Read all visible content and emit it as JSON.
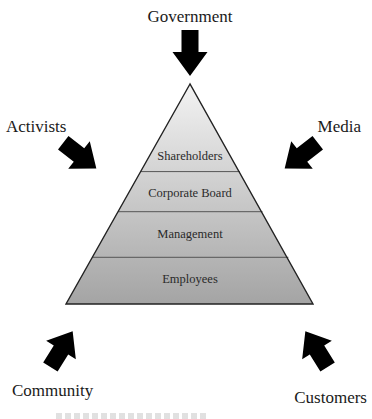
{
  "diagram": {
    "type": "stakeholder-pyramid",
    "pyramid": {
      "tiers": [
        {
          "label": "Shareholders"
        },
        {
          "label": "Corporate Board"
        },
        {
          "label": "Management"
        },
        {
          "label": "Employees"
        }
      ],
      "fill_top": "#f3f3f3",
      "fill_bottom": "#a4a4a4",
      "outline_color": "#222222"
    },
    "external_forces": [
      {
        "id": "government",
        "label": "Government",
        "position": "top",
        "arrow_direction": "down"
      },
      {
        "id": "activists",
        "label": "Activists",
        "position": "upper-left",
        "arrow_direction": "down-right"
      },
      {
        "id": "media",
        "label": "Media",
        "position": "upper-right",
        "arrow_direction": "down-left"
      },
      {
        "id": "community",
        "label": "Community",
        "position": "bottom-left",
        "arrow_direction": "up-right"
      },
      {
        "id": "customers",
        "label": "Customers",
        "position": "bottom-right",
        "arrow_direction": "up-left"
      }
    ],
    "arrow_color": "#000000"
  }
}
